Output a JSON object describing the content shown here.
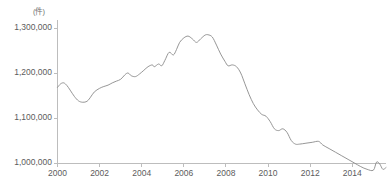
{
  "title_faint": "",
  "chart_data": {
    "type": "line",
    "title": "",
    "xlabel": "",
    "ylabel": "",
    "unit_label": "(件)",
    "ylim": [
      950000,
      1300000
    ],
    "xlim": [
      2000,
      2015.6
    ],
    "grid": false,
    "legend": null,
    "y_ticks": [
      1000000,
      1100000,
      1200000,
      1300000
    ],
    "y_tick_labels": [
      "1,000,000",
      "1,100,000",
      "1,200,000",
      "1,300,000"
    ],
    "x_ticks": [
      2000,
      2002,
      2004,
      2006,
      2008,
      2010,
      2012,
      2014
    ],
    "x_tick_labels": [
      "2000",
      "2002",
      "2004",
      "2006",
      "2008",
      "2010",
      "2012",
      "2014"
    ],
    "line_color": "#8a8a8a",
    "axis_color": "#bdbdbd",
    "background": "#ffffff",
    "series": [
      {
        "name": "series-1",
        "x": [
          2000.0,
          2000.15,
          2000.3,
          2000.45,
          2000.6,
          2000.8,
          2001.0,
          2001.2,
          2001.4,
          2001.55,
          2001.75,
          2002.0,
          2002.2,
          2002.4,
          2002.6,
          2002.8,
          2003.0,
          2003.2,
          2003.35,
          2003.5,
          2003.7,
          2003.9,
          2004.1,
          2004.3,
          2004.5,
          2004.6,
          2004.8,
          2004.95,
          2005.1,
          2005.3,
          2005.5,
          2005.65,
          2005.8,
          2006.0,
          2006.2,
          2006.4,
          2006.6,
          2006.8,
          2007.0,
          2007.15,
          2007.35,
          2007.55,
          2007.75,
          2007.95,
          2008.1,
          2008.3,
          2008.5,
          2008.7,
          2008.9,
          2009.1,
          2009.3,
          2009.5,
          2009.7,
          2009.9,
          2010.1,
          2010.3,
          2010.5,
          2010.7,
          2010.9,
          2011.1,
          2011.3,
          2011.5,
          2011.8,
          2012.1,
          2012.4,
          2012.6,
          2012.9,
          2013.2,
          2013.5,
          2013.8,
          2014.1,
          2014.4,
          2014.7,
          2015.0,
          2015.15,
          2015.3,
          2015.45,
          2015.6
        ],
        "y": [
          1168000,
          1176000,
          1178000,
          1172000,
          1162000,
          1148000,
          1138000,
          1135000,
          1137000,
          1145000,
          1158000,
          1166000,
          1170000,
          1173000,
          1178000,
          1182000,
          1186000,
          1196000,
          1200000,
          1194000,
          1192000,
          1198000,
          1206000,
          1214000,
          1218000,
          1214000,
          1220000,
          1216000,
          1228000,
          1246000,
          1240000,
          1252000,
          1268000,
          1278000,
          1282000,
          1276000,
          1268000,
          1276000,
          1284000,
          1285000,
          1280000,
          1262000,
          1242000,
          1226000,
          1216000,
          1218000,
          1214000,
          1200000,
          1176000,
          1152000,
          1132000,
          1118000,
          1108000,
          1104000,
          1092000,
          1076000,
          1072000,
          1076000,
          1068000,
          1050000,
          1042000,
          1042000,
          1044000,
          1046000,
          1048000,
          1040000,
          1032000,
          1024000,
          1016000,
          1008000,
          1000000,
          992000,
          986000,
          984000,
          1002000,
          998000,
          986000,
          990000
        ]
      }
    ]
  }
}
